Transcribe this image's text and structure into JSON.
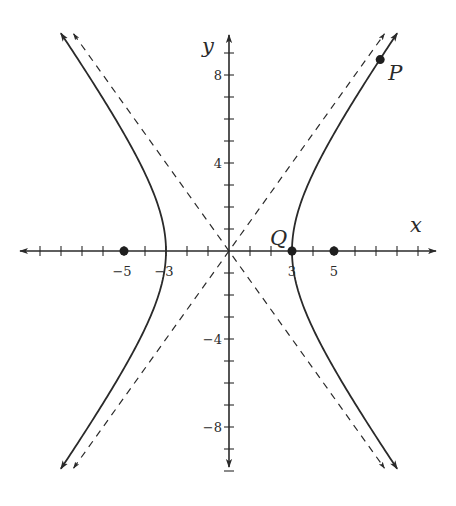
{
  "chart_data": {
    "type": "line",
    "title": "",
    "equation": "x^2/9 - y^2/16 = 1",
    "xlabel": "x",
    "ylabel": "y",
    "xlim": [
      -10,
      10
    ],
    "ylim": [
      -10,
      10
    ],
    "x_tick_labels": [
      {
        "value": -5,
        "label": "−5"
      },
      {
        "value": -3,
        "label": "−3"
      },
      {
        "value": 3,
        "label": "3"
      },
      {
        "value": 5,
        "label": "5"
      }
    ],
    "y_tick_labels": [
      {
        "value": 8,
        "label": "8"
      },
      {
        "value": 4,
        "label": "4"
      },
      {
        "value": -4,
        "label": "−4"
      },
      {
        "value": -8,
        "label": "−8"
      }
    ],
    "x_minor_ticks": [
      -9,
      -8,
      -7,
      -6,
      -5,
      -4,
      -3,
      -2,
      -1,
      1,
      2,
      3,
      4,
      5,
      6,
      7,
      8,
      9
    ],
    "y_minor_ticks": [
      -10,
      -9,
      -8,
      -7,
      -6,
      -5,
      -4,
      -3,
      -2,
      -1,
      1,
      2,
      3,
      4,
      5,
      6,
      7,
      8,
      9
    ],
    "series": [
      {
        "name": "hyperbola-right-branch",
        "style": "solid",
        "a": 3,
        "b": 4,
        "branch": 1,
        "y_range": [
          -9.9,
          9.9
        ]
      },
      {
        "name": "hyperbola-left-branch",
        "style": "solid",
        "a": 3,
        "b": 4,
        "branch": -1,
        "y_range": [
          -9.9,
          9.9
        ]
      },
      {
        "name": "asymptote-positive",
        "style": "dashed",
        "slope": 1.3333,
        "x_range": [
          -7.4,
          7.4
        ]
      },
      {
        "name": "asymptote-negative",
        "style": "dashed",
        "slope": -1.3333,
        "x_range": [
          -7.4,
          7.4
        ]
      }
    ],
    "points": [
      {
        "name": "focus-left",
        "x": -5,
        "y": 0,
        "label": ""
      },
      {
        "name": "vertex-Q",
        "x": 3,
        "y": 0,
        "label": "Q"
      },
      {
        "name": "focus-right",
        "x": 5,
        "y": 0,
        "label": ""
      },
      {
        "name": "point-P",
        "x": 7.2,
        "y": 8.7,
        "label": "P"
      }
    ],
    "grid": false,
    "legend": null
  },
  "layout": {
    "origin_px": [
      229,
      251
    ],
    "x_scale_px": 21,
    "y_scale_px": 22,
    "x_axis_px": [
      20,
      436
    ],
    "y_axis_px": [
      35,
      467
    ],
    "stroke_color": "#2a2a2a"
  }
}
